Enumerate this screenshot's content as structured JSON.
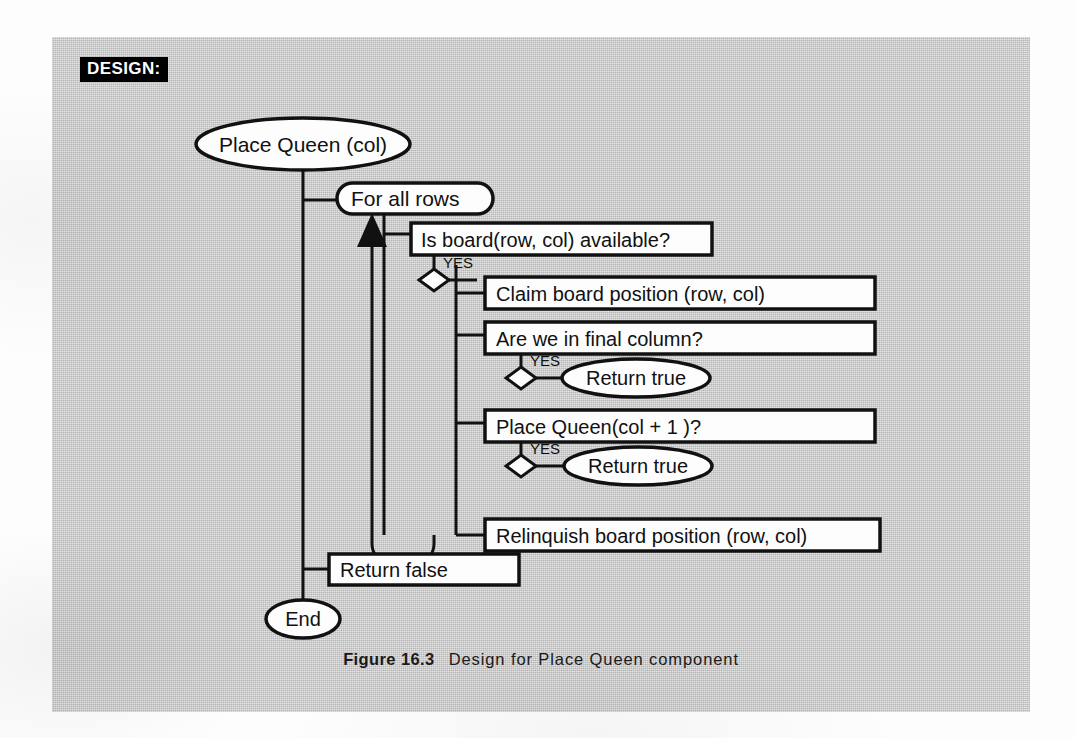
{
  "page": {
    "background_color": "#fdfdfd",
    "panel_color": "#c9c9c9"
  },
  "design_tag": {
    "label": "DESIGN:",
    "background_color": "#000000",
    "text_color": "#ffffff"
  },
  "caption": {
    "figure_label": "Figure 16.3",
    "figure_text": "Design for Place Queen component"
  },
  "diagram": {
    "title": "Design for Place Queen component",
    "type": "structured-flow-chart",
    "nodes": [
      {
        "id": "start",
        "shape": "ellipse",
        "label": "Place Queen (col)"
      },
      {
        "id": "loop",
        "shape": "rounded-rect",
        "label": "For all  rows"
      },
      {
        "id": "cond1",
        "shape": "rect",
        "label": "Is board(row, col) available?"
      },
      {
        "id": "claim",
        "shape": "rect",
        "label": "Claim board position (row, col)"
      },
      {
        "id": "cond2",
        "shape": "rect",
        "label": "Are we in final column?"
      },
      {
        "id": "return-true1",
        "shape": "ellipse",
        "label": "Return true"
      },
      {
        "id": "cond3",
        "shape": "rect",
        "label": "Place Queen(col + 1 )?"
      },
      {
        "id": "return-true2",
        "shape": "ellipse",
        "label": "Return true"
      },
      {
        "id": "relinquish",
        "shape": "rect",
        "label": "Relinquish  board position (row, col)"
      },
      {
        "id": "return-false",
        "shape": "rect",
        "label": "Return false"
      },
      {
        "id": "end",
        "shape": "ellipse",
        "label": "End"
      }
    ],
    "decisions": [
      {
        "id": "diamond1",
        "shape": "diamond",
        "branch_label": "YES",
        "from": "cond1",
        "to": "claim"
      },
      {
        "id": "diamond2",
        "shape": "diamond",
        "branch_label": "YES",
        "from": "cond2",
        "to": "return-true1"
      },
      {
        "id": "diamond3",
        "shape": "diamond",
        "branch_label": "YES",
        "from": "cond3",
        "to": "return-true2"
      }
    ],
    "loop_back": {
      "id": "loop-arrow",
      "description": "iteration arrow returning to For all rows",
      "arrowhead": "up"
    }
  }
}
